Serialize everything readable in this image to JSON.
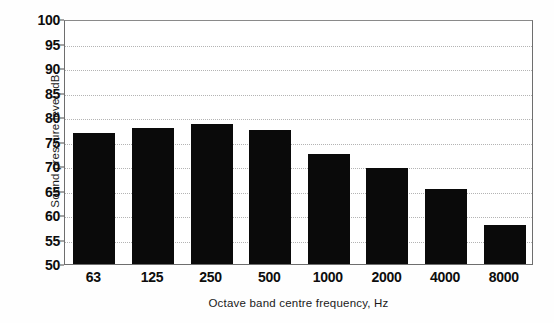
{
  "chart_data": {
    "type": "bar",
    "title": "",
    "subtitle": "",
    "xlabel": "Octave band centre frequency, Hz",
    "ylabel": "Sound pressure level, dB",
    "categories": [
      "63",
      "125",
      "250",
      "500",
      "1000",
      "2000",
      "4000",
      "8000"
    ],
    "values": [
      76.8,
      77.7,
      78.6,
      77.4,
      72.5,
      69.6,
      65.4,
      58.0
    ],
    "series": [
      {
        "name": "Sound pressure level",
        "values": [
          76.8,
          77.7,
          78.6,
          77.4,
          72.5,
          69.6,
          65.4,
          58.0
        ],
        "color": "#0a0a0a"
      }
    ],
    "ylim": [
      50,
      100
    ],
    "yticks": [
      50,
      55,
      60,
      65,
      70,
      75,
      80,
      85,
      90,
      95,
      100
    ],
    "ytick_labels": [
      "50",
      "55",
      "60",
      "65",
      "70",
      "75",
      "80",
      "85",
      "90",
      "95",
      "100"
    ],
    "xtick_labels": [
      "63",
      "125",
      "250",
      "500",
      "1000",
      "2000",
      "4000",
      "8000"
    ],
    "grid": "horizontal-dotted",
    "legend": "none",
    "annotations": [],
    "bar_color": "#0a0a0a",
    "gridline_color": "#b4b4b4",
    "axis_color": "#6e6e6e"
  }
}
